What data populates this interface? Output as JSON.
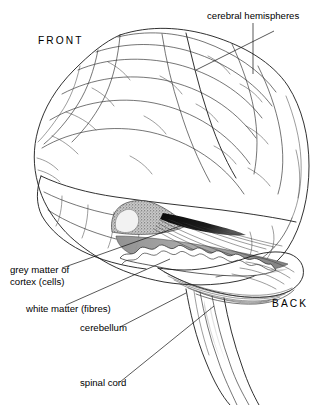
{
  "figure": {
    "background_color": "#ffffff",
    "ink_color": "#1a1a1a"
  },
  "orientation_labels": [
    {
      "id": "front",
      "text": "FRONT",
      "x": 38,
      "y": 44
    },
    {
      "id": "back",
      "text": "BACK",
      "x": 272,
      "y": 307
    }
  ],
  "annotations": [
    {
      "id": "cerebral-hemispheres",
      "text": "cerebral hemispheres",
      "x": 207,
      "y": 19,
      "anchor": "start"
    },
    {
      "id": "grey-matter-line1",
      "text": "grey matter of",
      "x": 10,
      "y": 273,
      "anchor": "start"
    },
    {
      "id": "grey-matter-line2",
      "text": "cortex  (cells)",
      "x": 10,
      "y": 285,
      "anchor": "start"
    },
    {
      "id": "white-matter",
      "text": "white matter (fibres)",
      "x": 26,
      "y": 312,
      "anchor": "start"
    },
    {
      "id": "cerebellum",
      "text": "cerebellum",
      "x": 80,
      "y": 331,
      "anchor": "start"
    },
    {
      "id": "spinal-cord",
      "text": "spinal cord",
      "x": 80,
      "y": 386,
      "anchor": "start"
    }
  ],
  "shading": {
    "grey_matter_fill": "#9a9a9a",
    "stipple_fill": "#7d7d7d",
    "ventricle_fill": "#0d0d0d",
    "white_matter_fill": "#ffffff",
    "soft_grey_fill": "#b9b9b9"
  }
}
